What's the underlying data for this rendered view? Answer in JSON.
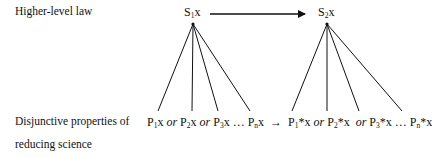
{
  "labels": {
    "higher_level": "Higher-level law",
    "disjunctive_line1": "Disjunctive properties of",
    "disjunctive_line2": "reducing science"
  },
  "top_nodes": [
    {
      "base": "S",
      "sub": "1",
      "var": "x"
    },
    {
      "base": "S",
      "sub": "2",
      "var": "x"
    }
  ],
  "left_disjunction": {
    "terms": [
      {
        "base": "P",
        "sub": "1",
        "var": "x"
      },
      {
        "base": "P",
        "sub": "2",
        "var": "x"
      },
      {
        "base": "P",
        "sub": "3",
        "var": "x"
      },
      {
        "base": "P",
        "sub": "n",
        "var": "x"
      }
    ],
    "connectives": [
      "or",
      "or",
      "…"
    ]
  },
  "implies": "→",
  "right_disjunction": {
    "terms": [
      {
        "base": "P",
        "sub": "1",
        "var": "*x"
      },
      {
        "base": "P",
        "sub": "2",
        "var": "*x"
      },
      {
        "base": "P",
        "sub": "3",
        "var": "*x"
      },
      {
        "base": "P",
        "sub": "n",
        "var": "*x"
      }
    ],
    "connectives": [
      "or",
      "or",
      "…"
    ]
  },
  "edges": {
    "top_arrow": {
      "from": "S1x",
      "to": "S2x"
    },
    "fan_left": {
      "from": "S1x",
      "to": [
        "P1x",
        "P2x",
        "P3x",
        "Pnx"
      ]
    },
    "fan_right": {
      "from": "S2x",
      "to": [
        "P1*x",
        "P2*x",
        "P3*x",
        "Pn*x"
      ]
    }
  }
}
